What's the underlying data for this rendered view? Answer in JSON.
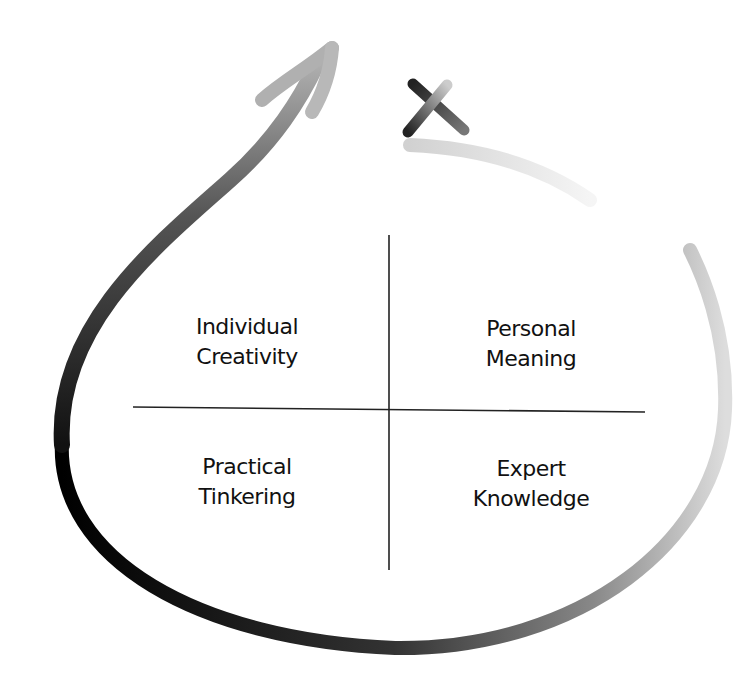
{
  "diagram": {
    "quadrants": [
      {
        "position": "top-left",
        "lines": [
          "Individual",
          "Creativity"
        ]
      },
      {
        "position": "top-right",
        "lines": [
          "Personal",
          "Meaning"
        ]
      },
      {
        "position": "bottom-left",
        "lines": [
          "Practical",
          "Tinkering"
        ]
      },
      {
        "position": "bottom-right",
        "lines": [
          "Expert",
          "Knowledge"
        ]
      }
    ],
    "icons": [
      "loop-arrow-icon",
      "x-mark-icon"
    ],
    "colors": {
      "dark": "#111111",
      "mid": "#888888",
      "light": "#dddddd"
    }
  }
}
